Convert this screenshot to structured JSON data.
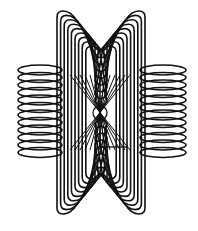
{
  "figure": {
    "background": "#ffffff",
    "stroke_color": "#111111",
    "vertical_loops": {
      "count": 9,
      "outer": {
        "x_left": 57,
        "x_right": 145,
        "y_top": 11,
        "y_bottom": 214
      },
      "step": 4,
      "pinch_depth": 40
    },
    "horizontal_rings": {
      "count": 12,
      "left": {
        "cx_outer": 18,
        "cx_inner": 75
      },
      "right": {
        "cx_inner": 125,
        "cx_outer": 186
      },
      "y_start": 70,
      "y_step": 7.5,
      "ry": 5
    },
    "center_circle": {
      "cx": 100,
      "cy": 113,
      "r": 7
    }
  }
}
